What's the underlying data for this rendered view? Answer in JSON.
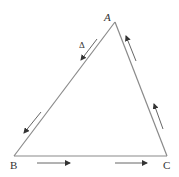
{
  "diagram": {
    "title": "",
    "vertices": [
      {
        "id": "A",
        "label": "A",
        "x": 115,
        "y": 22
      },
      {
        "id": "B",
        "label": "B",
        "x": 14,
        "y": 156
      },
      {
        "id": "C",
        "label": "C",
        "x": 167,
        "y": 156
      }
    ],
    "edges": [
      {
        "from": "A",
        "to": "B",
        "direction": "A→B",
        "arrows": 2
      },
      {
        "from": "B",
        "to": "C",
        "direction": "B→C",
        "arrows": 2
      },
      {
        "from": "C",
        "to": "A",
        "direction": "C→A",
        "arrows": 2
      }
    ],
    "annotations": [
      {
        "text": "Δ",
        "near_edge": "AB"
      }
    ],
    "labels": {
      "A": "A",
      "B": "B",
      "C": "C",
      "delta": "Δ"
    },
    "colors": {
      "line": "#888888",
      "arrow": "#333333",
      "text": "#333333"
    }
  }
}
